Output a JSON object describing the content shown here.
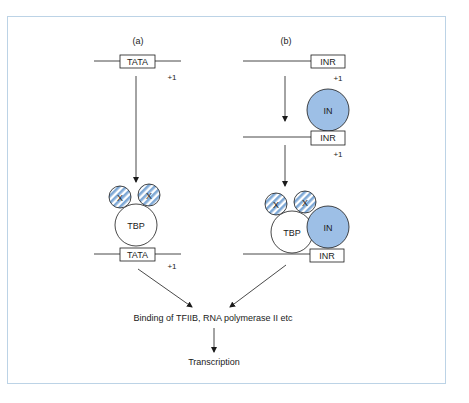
{
  "diagram": {
    "panels": {
      "a": {
        "label": "(a)",
        "top_box": "TATA",
        "top_plus": "+1",
        "x_left": "X",
        "x_right": "X",
        "tbp": "TBP",
        "bottom_box": "TATA",
        "bottom_plus": "+1"
      },
      "b": {
        "label": "(b)",
        "top_box": "INR",
        "top_plus": "+1",
        "in_mid": "IN",
        "mid_box": "INR",
        "mid_plus": "+1",
        "x_left": "X",
        "x_right": "X",
        "tbp": "TBP",
        "in_bottom": "IN",
        "bottom_box": "INR"
      }
    },
    "convergence_text": "Binding of TFIIB, RNA polymerase II etc",
    "final_text": "Transcription",
    "colors": {
      "frame": "#bcd3e6",
      "in_fill": "#9dbfe6",
      "stripe": "#7fa9d6",
      "line": "#1a1a1a"
    }
  }
}
